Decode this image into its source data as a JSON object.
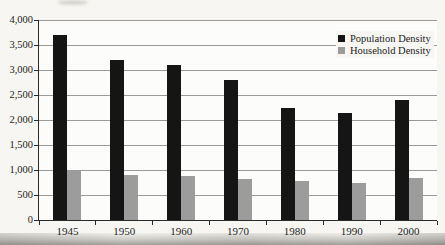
{
  "chart_data": {
    "type": "bar",
    "title": "",
    "xlabel": "",
    "ylabel": "",
    "categories": [
      "1945",
      "1950",
      "1960",
      "1970",
      "1980",
      "1990",
      "2000"
    ],
    "series": [
      {
        "name": "Population Density",
        "color": "#151515",
        "values": [
          3700,
          3200,
          3100,
          2800,
          2250,
          2150,
          2400
        ]
      },
      {
        "name": "Household Density",
        "color": "#9c9c9c",
        "values": [
          1000,
          900,
          875,
          825,
          775,
          750,
          850
        ]
      }
    ],
    "ylim": [
      0,
      4000
    ],
    "ytick_step": 500,
    "ytick_labels": [
      "0",
      "500",
      "1,000",
      "1,500",
      "2,000",
      "2,500",
      "3,000",
      "3,500",
      "4,000"
    ],
    "grid": true,
    "legend_position": "top-right"
  },
  "colors": {
    "page_bg": "#f7f6f2",
    "plot_bg": "#fcfcfa",
    "grid": "#9a9a9a",
    "axis": "#2a2a2a",
    "text": "#1c1c1c"
  }
}
